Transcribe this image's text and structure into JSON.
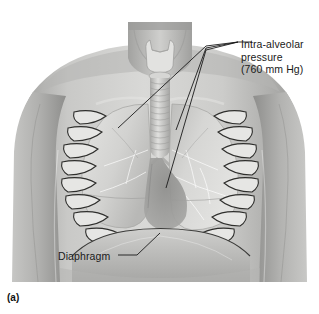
{
  "figure": {
    "caption": "(a)",
    "style": "grayscale-anatomical-illustration",
    "background_color": "#ffffff"
  },
  "labels": {
    "intra_alveolar": {
      "name": "intra-alveolar-pressure",
      "line1": "Intra-alveolar",
      "line2": "pressure",
      "line3": "(760 mm Hg)",
      "value": "760",
      "unit": "mm Hg",
      "leader_count": 3
    },
    "diaphragm": {
      "name": "diaphragm",
      "text": "Diaphragm",
      "leader_count": 1
    }
  },
  "anatomy": {
    "parts": [
      "larynx",
      "trachea",
      "right-lung",
      "left-lung",
      "rib-cage",
      "heart-mediastinum",
      "diaphragm",
      "clavicle",
      "shoulders",
      "arms",
      "neck",
      "abdomen"
    ]
  },
  "colors": {
    "skin_light": "#d8d8d6",
    "skin_mid": "#b6b6b4",
    "skin_dark": "#8f8f8d",
    "lung_light": "#dedede",
    "lung_mid": "#c4c4c2",
    "rib_light": "#e8e8e6",
    "rib_dark": "#3a3a38",
    "heart_shadow": "#8a8a88",
    "leader_line": "#1a1a1a",
    "text": "#1a1a1a"
  }
}
